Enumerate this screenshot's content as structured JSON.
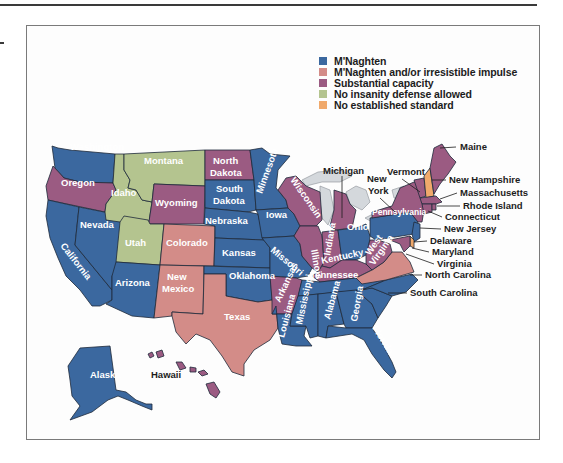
{
  "legend": {
    "items": [
      {
        "label": "M'Naghten",
        "color": "#3b689f"
      },
      {
        "label": "M'Naghten and/or irresistible impulse",
        "color": "#d38c88"
      },
      {
        "label": "Substantial capacity",
        "color": "#9b5b82"
      },
      {
        "label": "No insanity defense allowed",
        "color": "#b4c48f"
      },
      {
        "label": "No established standard",
        "color": "#f0a96b"
      }
    ]
  },
  "states": {
    "washington": {
      "label": "Washington",
      "standard": "M'Naghten"
    },
    "oregon": {
      "label": "Oregon",
      "standard": "Substantial capacity"
    },
    "california": {
      "label": "California",
      "standard": "M'Naghten"
    },
    "nevada": {
      "label": "Nevada",
      "standard": "M'Naghten"
    },
    "idaho": {
      "label": "Idaho",
      "standard": "No insanity defense allowed"
    },
    "montana": {
      "label": "Montana",
      "standard": "No insanity defense allowed"
    },
    "wyoming": {
      "label": "Wyoming",
      "standard": "Substantial capacity"
    },
    "utah": {
      "label": "Utah",
      "standard": "No insanity defense allowed"
    },
    "colorado": {
      "label": "Colorado",
      "standard": "M'Naghten and/or irresistible impulse"
    },
    "arizona": {
      "label": "Arizona",
      "standard": "M'Naghten"
    },
    "new_mexico": {
      "label": "New Mexico",
      "standard": "M'Naghten and/or irresistible impulse"
    },
    "north_dakota": {
      "label": "North Dakota",
      "standard": "Substantial capacity"
    },
    "south_dakota": {
      "label": "South Dakota",
      "standard": "M'Naghten"
    },
    "nebraska": {
      "label": "Nebraska",
      "standard": "M'Naghten"
    },
    "kansas": {
      "label": "Kansas",
      "standard": "M'Naghten"
    },
    "oklahoma": {
      "label": "Oklahoma",
      "standard": "M'Naghten"
    },
    "texas": {
      "label": "Texas",
      "standard": "M'Naghten and/or irresistible impulse"
    },
    "minnesota": {
      "label": "Minnesota",
      "standard": "M'Naghten"
    },
    "iowa": {
      "label": "Iowa",
      "standard": "M'Naghten"
    },
    "missouri": {
      "label": "Missouri",
      "standard": "M'Naghten"
    },
    "arkansas": {
      "label": "Arkansas",
      "standard": "Substantial capacity"
    },
    "louisiana": {
      "label": "Louisiana",
      "standard": "M'Naghten"
    },
    "wisconsin": {
      "label": "Wisconsin",
      "standard": "Substantial capacity"
    },
    "illinois": {
      "label": "Illinois",
      "standard": "Substantial capacity"
    },
    "michigan": {
      "label": "Michigan",
      "standard": "Substantial capacity"
    },
    "indiana": {
      "label": "Indiana",
      "standard": "Substantial capacity"
    },
    "ohio": {
      "label": "Ohio",
      "standard": "M'Naghten"
    },
    "kentucky": {
      "label": "Kentucky",
      "standard": "Substantial capacity"
    },
    "tennessee": {
      "label": "Tennessee",
      "standard": "M'Naghten"
    },
    "mississippi": {
      "label": "Mississippi",
      "standard": "M'Naghten"
    },
    "alabama": {
      "label": "Alabama",
      "standard": "M'Naghten"
    },
    "georgia": {
      "label": "Georgia",
      "standard": "M'Naghten"
    },
    "florida": {
      "label": "Florida",
      "standard": "M'Naghten"
    },
    "west_virginia": {
      "label": "West Virginia",
      "standard": "Substantial capacity"
    },
    "virginia": {
      "label": "Virginia",
      "standard": "M'Naghten and/or irresistible impulse"
    },
    "north_carolina": {
      "label": "North Carolina",
      "standard": "M'Naghten"
    },
    "south_carolina": {
      "label": "South Carolina",
      "standard": "M'Naghten"
    },
    "pennsylvania": {
      "label": "Pennsylvania",
      "standard": "M'Naghten"
    },
    "new_york": {
      "label": "New York",
      "standard": "Substantial capacity"
    },
    "vermont": {
      "label": "Vermont",
      "standard": "Substantial capacity"
    },
    "new_hampshire": {
      "label": "New Hampshire",
      "standard": "No established standard"
    },
    "maine": {
      "label": "Maine",
      "standard": "Substantial capacity"
    },
    "massachusetts": {
      "label": "Massachusetts",
      "standard": "Substantial capacity"
    },
    "rhode_island": {
      "label": "Rhode Island",
      "standard": "Substantial capacity"
    },
    "connecticut": {
      "label": "Connecticut",
      "standard": "Substantial capacity"
    },
    "new_jersey": {
      "label": "New Jersey",
      "standard": "M'Naghten"
    },
    "delaware": {
      "label": "Delaware",
      "standard": "M'Naghten and/or irresistible impulse"
    },
    "maryland": {
      "label": "Maryland",
      "standard": "Substantial capacity"
    },
    "alaska": {
      "label": "Alaska",
      "standard": "M'Naghten"
    },
    "hawaii": {
      "label": "Hawaii",
      "standard": "Substantial capacity"
    }
  },
  "callouts": {
    "new_york_line1": "New",
    "new_york_line2": "York",
    "north_dakota_line1": "North",
    "north_dakota_line2": "Dakota",
    "south_dakota_line1": "South",
    "south_dakota_line2": "Dakota",
    "new_mexico_line1": "New",
    "new_mexico_line2": "Mexico",
    "west_virginia_line1": "West",
    "west_virginia_line2": "Virginia"
  }
}
